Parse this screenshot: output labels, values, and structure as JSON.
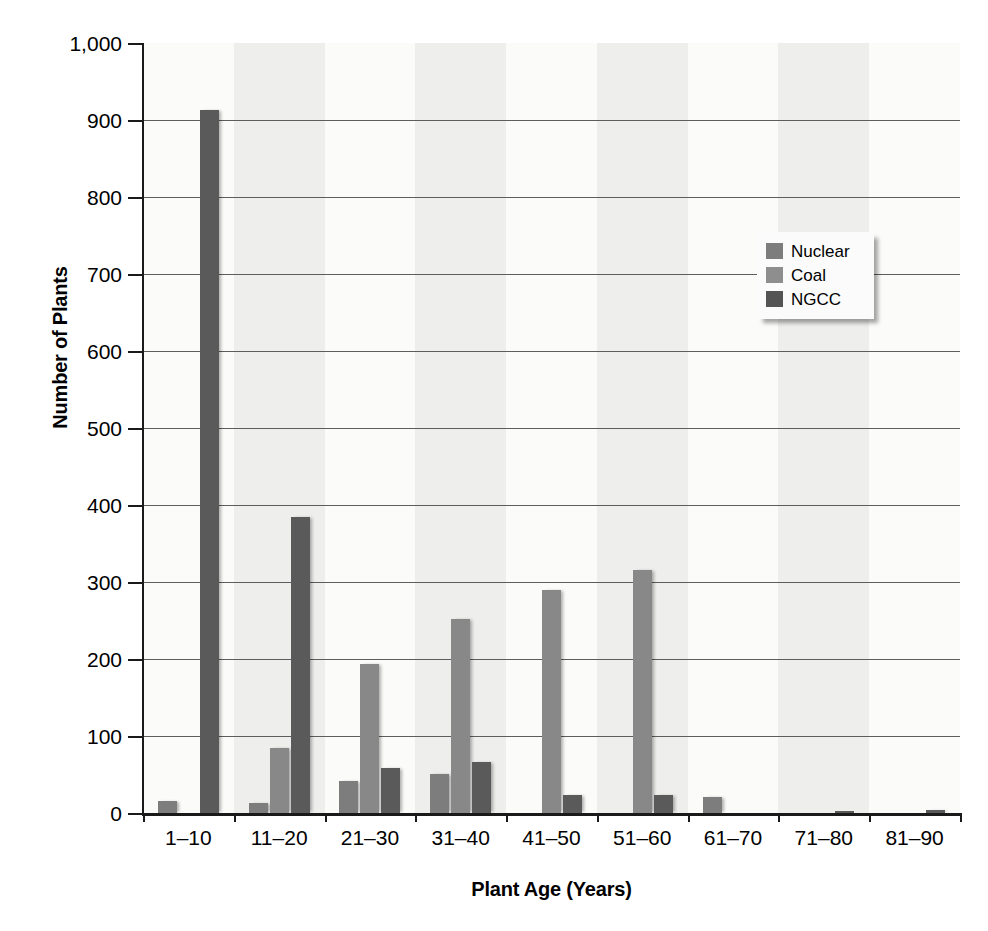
{
  "chart_data": {
    "type": "bar",
    "title": "",
    "xlabel": "Plant Age (Years)",
    "ylabel": "Number of Plants",
    "categories": [
      "1–10",
      "11–20",
      "21–30",
      "31–40",
      "41–50",
      "51–60",
      "61–70",
      "71–80",
      "81–90"
    ],
    "series": [
      {
        "name": "Nuclear",
        "color": "#7d7d7d",
        "values": [
          15,
          13,
          41,
          51,
          0,
          0,
          21,
          0,
          0
        ]
      },
      {
        "name": "Coal",
        "color": "#8e8e8e",
        "values": [
          0,
          85,
          193,
          252,
          289,
          315,
          0,
          0,
          0
        ]
      },
      {
        "name": "NGCC",
        "color": "#545454",
        "values": [
          913,
          385,
          58,
          66,
          24,
          23,
          0,
          2,
          4
        ]
      }
    ],
    "ylim": [
      0,
      1000
    ],
    "ytick_values": [
      0,
      100,
      200,
      300,
      400,
      500,
      600,
      700,
      800,
      900,
      1000
    ],
    "ytick_labels": [
      "0",
      "100",
      "200",
      "300",
      "400",
      "500",
      "600",
      "700",
      "800",
      "900",
      "1,000"
    ],
    "grid": true,
    "legend_position": "upper-right",
    "plot_background": "#f2f2f0",
    "gridline_color": "#5d5d5d",
    "axis_color": "#1a1a1a"
  },
  "legend": {
    "entries": [
      {
        "label": "Nuclear",
        "swatch": "nuclear"
      },
      {
        "label": "Coal",
        "swatch": "coal"
      },
      {
        "label": "NGCC",
        "swatch": "ngcc"
      }
    ]
  }
}
